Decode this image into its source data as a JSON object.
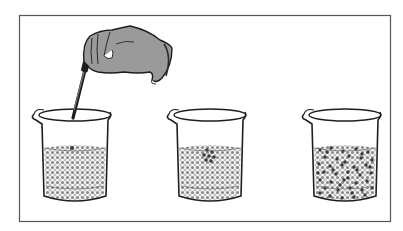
{
  "figure": {
    "colors": {
      "frame": "#555555",
      "glove": "#9a9a9a",
      "outline": "#1e1e1e",
      "water_particle": "#8a8a8a",
      "dye_particle": "#3a3a3a"
    },
    "panels": [
      {
        "id": "beaker-1",
        "state": "dye being added",
        "dye_particles": 1
      },
      {
        "id": "beaker-2",
        "state": "dye clustered near top",
        "dye_particles": 7
      },
      {
        "id": "beaker-3",
        "state": "dye evenly dispersed",
        "dye_particles": 45
      }
    ]
  }
}
